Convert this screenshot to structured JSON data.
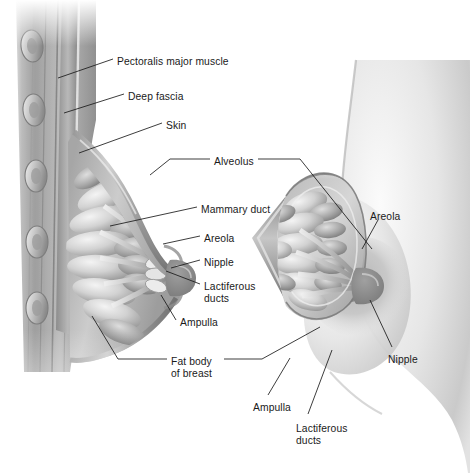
{
  "figure": {
    "background_color": "#ffffff",
    "text_color": "#1a1a1a",
    "leader_line_color": "#1a1a1a",
    "tone_dark": "#6f6f6f",
    "tone_mid": "#a8a8a8",
    "tone_light": "#dcdcdc",
    "tone_highlight": "#f2f2f2"
  },
  "labels": [
    {
      "id": "pectoralis-major-muscle",
      "text": "Pectoralis major muscle",
      "x": 117,
      "y": 56,
      "align": "left"
    },
    {
      "id": "deep-fascia",
      "text": "Deep fascia",
      "x": 128,
      "y": 91,
      "align": "left"
    },
    {
      "id": "skin",
      "text": "Skin",
      "x": 166,
      "y": 120,
      "align": "left"
    },
    {
      "id": "alveolus",
      "text": "Alveolus",
      "x": 214,
      "y": 156,
      "align": "left"
    },
    {
      "id": "mammary-duct",
      "text": "Mammary duct",
      "x": 201,
      "y": 204,
      "align": "left"
    },
    {
      "id": "areola-left",
      "text": "Areola",
      "x": 204,
      "y": 233,
      "align": "left"
    },
    {
      "id": "nipple-left",
      "text": "Nipple",
      "x": 204,
      "y": 257,
      "align": "left"
    },
    {
      "id": "lactiferous-ducts-left",
      "text": "Lactiferous\nducts",
      "x": 204,
      "y": 281,
      "align": "left"
    },
    {
      "id": "ampulla-left",
      "text": "Ampulla",
      "x": 180,
      "y": 317,
      "align": "left"
    },
    {
      "id": "fat-body-of-breast",
      "text": "Fat body\nof breast",
      "x": 171,
      "y": 356,
      "align": "left"
    },
    {
      "id": "areola-right",
      "text": "Areola",
      "x": 370,
      "y": 211,
      "align": "left"
    },
    {
      "id": "nipple-right",
      "text": "Nipple",
      "x": 388,
      "y": 354,
      "align": "left"
    },
    {
      "id": "ampulla-bottom",
      "text": "Ampulla",
      "x": 253,
      "y": 402,
      "align": "left"
    },
    {
      "id": "lactiferous-ducts-bottom",
      "text": "Lactiferous\nducts",
      "x": 296,
      "y": 423,
      "align": "left"
    }
  ],
  "leaders": [
    {
      "id": "leader-pectoralis-major-muscle",
      "points": "113,59 58,78"
    },
    {
      "id": "leader-deep-fascia",
      "points": "124,94 64,113"
    },
    {
      "id": "leader-skin",
      "points": "162,123 79,153"
    },
    {
      "id": "leader-alveolus-left",
      "points": "210,159 170,159 150,175"
    },
    {
      "id": "leader-alveolus-right",
      "points": "258,159 300,159 372,249"
    },
    {
      "id": "leader-mammary-duct",
      "points": "197,207 110,226"
    },
    {
      "id": "leader-areola-left",
      "points": "200,236 163,244"
    },
    {
      "id": "leader-nipple-left",
      "points": "200,260 171,268"
    },
    {
      "id": "leader-lactiferous-ducts-left",
      "points": "200,284 166,271"
    },
    {
      "id": "leader-ampulla-left",
      "points": "176,320 161,295"
    },
    {
      "id": "leader-fat-body-of-breast-l",
      "points": "167,359 118,359 92,316"
    },
    {
      "id": "leader-fat-body-of-breast-r",
      "points": "224,359 262,359 320,327"
    },
    {
      "id": "leader-areola-right",
      "points": "378,220 362,249"
    },
    {
      "id": "leader-nipple-right",
      "points": "392,347 370,300"
    },
    {
      "id": "leader-ampulla-bottom",
      "points": "268,395 290,358"
    },
    {
      "id": "leader-lactiferous-ducts-bot",
      "points": "308,414 332,350"
    }
  ]
}
